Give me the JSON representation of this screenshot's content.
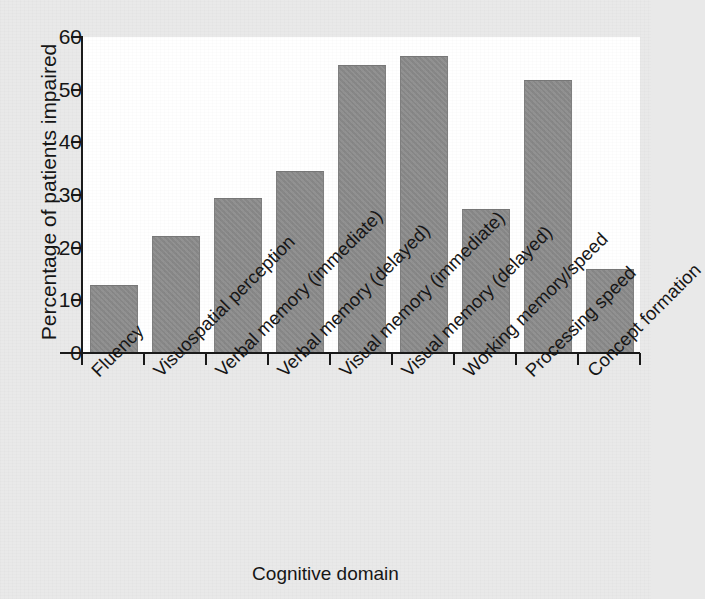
{
  "chart_data": {
    "type": "bar",
    "title": "",
    "xlabel": "Cognitive domain",
    "ylabel": "Percentage of patients impaired",
    "ylim": [
      0,
      60
    ],
    "yticks": [
      0,
      10,
      20,
      30,
      40,
      50,
      60
    ],
    "grid": false,
    "legend": false,
    "bar_color": "#8b8b8b",
    "categories": [
      "Fluency",
      "Visuospatial perception",
      "Verbal memory (immediate)",
      "Verbal memory (delayed)",
      "Visual memory (immediate)",
      "Visual memory (delayed)",
      "Working memory/speed",
      "Processing speed",
      "Concept formation"
    ],
    "values": [
      13.0,
      22.2,
      29.4,
      34.5,
      54.6,
      56.3,
      27.3,
      51.8,
      16.0
    ]
  },
  "axis": {
    "y_title": "Percentage of patients impaired",
    "x_title": "Cognitive domain",
    "tick_labels": [
      "0",
      "10",
      "20",
      "30",
      "40",
      "50",
      "60"
    ]
  },
  "colors": {
    "bar": "#8b8b8b",
    "axis": "#1a1a1a",
    "plot_background": "#ffffff",
    "page_background": "#e9e9e9",
    "text": "#161616"
  }
}
